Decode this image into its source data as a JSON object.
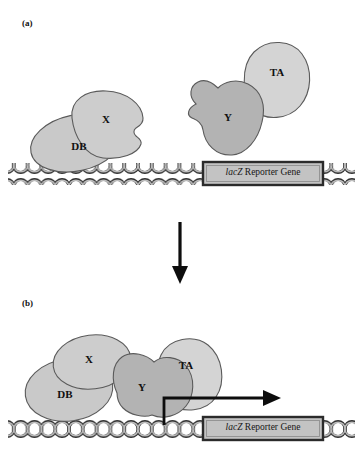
{
  "figure": {
    "background_color": "#ffffff",
    "width": 363,
    "height": 463
  },
  "panels": [
    {
      "id": "a",
      "label": "(a)",
      "description": "Unbound state: DB-X fusion on DNA, Y-TA fusion free in solution; reporter gene not transcribed",
      "proteins": [
        {
          "name": "DB",
          "label": "DB",
          "fill": "#c9c9c9",
          "stroke": "#5a5a5a"
        },
        {
          "name": "X",
          "label": "X",
          "fill": "#cdcdcd",
          "stroke": "#5a5a5a"
        },
        {
          "name": "Y",
          "label": "Y",
          "fill": "#b3b3b3",
          "stroke": "#5a5a5a"
        },
        {
          "name": "TA",
          "label": "TA",
          "fill": "#d4d4d4",
          "stroke": "#5a5a5a"
        }
      ],
      "gene_box": {
        "italic_text": "lacZ",
        "roman_text": " Reporter Gene",
        "fill": "#c3c3c3",
        "stroke": "#2b2b2b"
      },
      "transcription_arrow": false
    },
    {
      "id": "b",
      "label": "(b)",
      "description": "Bound state: X interacts with Y bringing TA to the promoter; transcription of the reporter gene is activated",
      "proteins": [
        {
          "name": "DB",
          "label": "DB",
          "fill": "#c9c9c9",
          "stroke": "#5a5a5a"
        },
        {
          "name": "X",
          "label": "X",
          "fill": "#cdcdcd",
          "stroke": "#5a5a5a"
        },
        {
          "name": "Y",
          "label": "Y",
          "fill": "#b3b3b3",
          "stroke": "#5a5a5a"
        },
        {
          "name": "TA",
          "label": "TA",
          "fill": "#d4d4d4",
          "stroke": "#5a5a5a"
        }
      ],
      "gene_box": {
        "italic_text": "lacZ",
        "roman_text": " Reporter Gene",
        "fill": "#c3c3c3",
        "stroke": "#2b2b2b"
      },
      "transcription_arrow": true
    }
  ],
  "dna": {
    "name": "double-helix-strand",
    "fill": "#bcbcbc",
    "stroke": "#2e2e2e",
    "description": "DNA double helix drawn as repeating interlocking loops"
  },
  "arrows": {
    "transition_arrow": {
      "name": "downward-transition-arrow",
      "direction": "down",
      "color": "#0d0d0d"
    },
    "transcription_arrow": {
      "name": "transcription-start-arrow",
      "direction": "right-bent-up",
      "color": "#0d0d0d"
    }
  },
  "colors": {
    "background": "#ffffff",
    "outline": "#5a5a5a",
    "text": "#101010",
    "protein_light": "#d4d4d4",
    "protein_mid": "#c9c9c9",
    "protein_dark": "#b3b3b3",
    "dna_fill": "#bcbcbc",
    "gene_fill": "#c3c3c3"
  }
}
